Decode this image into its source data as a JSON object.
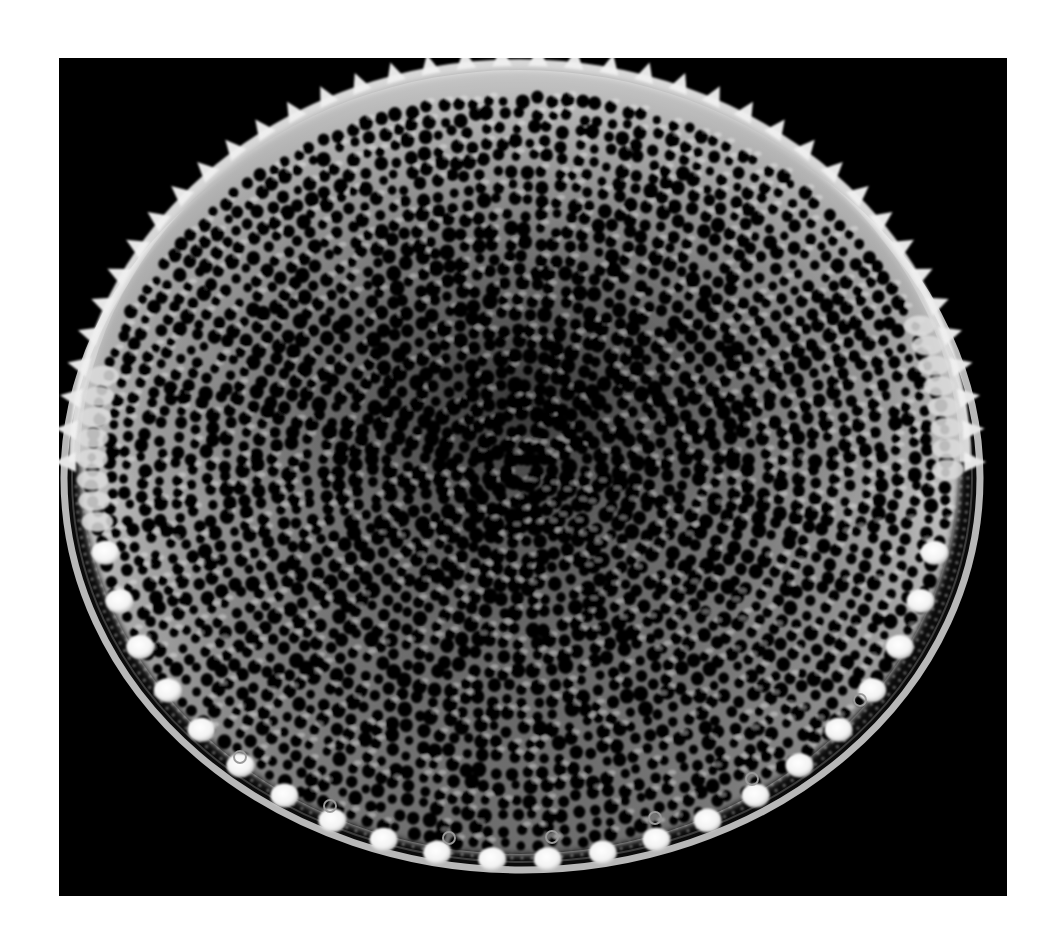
{
  "image": {
    "subject": "diatom valve (scanning electron micrograph)",
    "background_color": "#ffffff",
    "panel_color": "#000000",
    "panel": {
      "x": 59,
      "y": 58,
      "width": 948,
      "height": 838
    },
    "colors": {
      "dome_light": "#e8e8e8",
      "dome_mid": "#9a9a9a",
      "dome_dark": "#2a2a2a",
      "rim": "#b5b5b5",
      "knob": "#ffffff",
      "pore": "#050505"
    },
    "valve": {
      "cx": 520,
      "cy": 470,
      "rx": 455,
      "ry": 400
    },
    "rim": {
      "cx": 520,
      "cy": 478,
      "rx": 458,
      "ry": 392
    },
    "spine_count": 40,
    "knob_count": 22
  }
}
